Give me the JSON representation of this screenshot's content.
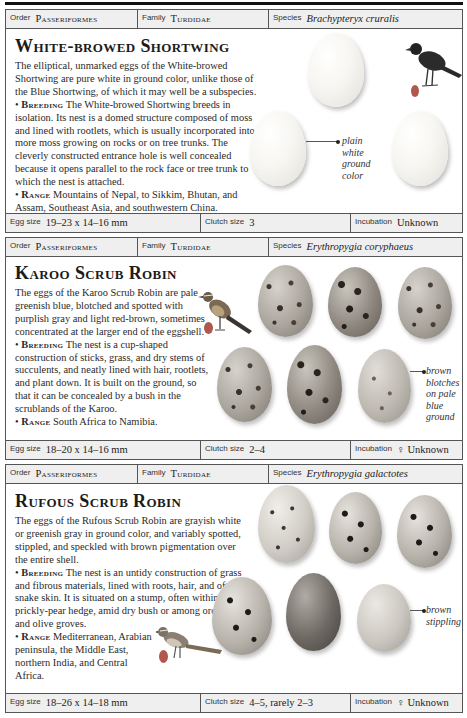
{
  "labels": {
    "order": "Order",
    "family": "Family",
    "species": "Species",
    "egg_size": "Egg size",
    "clutch_size": "Clutch size",
    "incubation": "Incubation"
  },
  "entries": [
    {
      "order": "Passeriformes",
      "family": "Turdidae",
      "species": "Brachypteryx cruralis",
      "title": "White-browed Shortwing",
      "description": "The elliptical, unmarked eggs of the White-browed Shortwing are pure white in ground color, unlike those of the Blue Shortwing, of which it may well be a subspecies.",
      "breeding_label": "Breeding",
      "breeding": "The White-browed Shortwing breeds in isolation. Its nest is a domed structure composed of moss and lined with rootlets, which is usually incorporated into more moss growing on rocks or on tree trunks. The cleverly constructed entrance hole is well concealed because it opens parallel to the rock face or tree trunk to which the nest is attached.",
      "range_label": "Range",
      "range": "Mountains of Nepal, to Sikkim, Bhutan, and Assam, Southeast Asia, and southwestern China.",
      "annotation": "plain white ground color",
      "egg_size": "19–23 x 14–16 mm",
      "clutch_size": "3",
      "incubation": "Unknown",
      "egg_count": 3,
      "egg_color": "#f7f6f2",
      "bird_icon": "dark-shortwing-bird-icon"
    },
    {
      "order": "Passeriformes",
      "family": "Turdidae",
      "species": "Erythropygia coryphaeus",
      "title": "Karoo Scrub Robin",
      "description": "The eggs of the Karoo Scrub Robin are pale greenish blue, blotched and spotted with purplish gray and light red-brown, sometimes concentrated at the larger end of the eggshell.",
      "breeding_label": "Breeding",
      "breeding": "The nest is a cup-shaped construction of sticks, grass, and dry stems of succulents, and neatly lined with hair, rootlets, and plant down. It is built on the ground, so that it can be concealed by a bush in the scrublands of the Karoo.",
      "range_label": "Range",
      "range": "South Africa to Namibia.",
      "annotation": "brown blotches on pale blue ground",
      "egg_size": "18–20 x 14–16 mm",
      "clutch_size": "2–4",
      "incubation": "♀ Unknown",
      "egg_count": 6,
      "egg_color": "#aaa59d",
      "bird_icon": "scrub-robin-bird-icon"
    },
    {
      "order": "Passeriformes",
      "family": "Turdidae",
      "species": "Erythropygia galactotes",
      "title": "Rufous Scrub Robin",
      "description": "The eggs of the Rufous Scrub Robin are grayish white or greenish gray in ground color, and variably spotted, stippled, and speckled with brown pigmentation over the entire shell.",
      "breeding_label": "Breeding",
      "breeding": "The nest is an untidy construction of grass and fibrous materials, lined with roots, hair, and often snake skin. It is situated on a stump, often within a prickly-pear hedge, amid dry bush or among orchards and olive groves.",
      "range_label": "Range",
      "range": "Mediterranean, Arabian peninsula, the Middle East, northern India, and Central Africa.",
      "annotation": "brown stippling",
      "egg_size": "18–26 x 14–18 mm",
      "clutch_size": "4–5, rarely 2–3",
      "incubation": "♀ Unknown",
      "egg_count": 6,
      "egg_color": "#d0ccc5",
      "bird_icon": "rufous-scrub-robin-bird-icon"
    }
  ],
  "colors": {
    "border": "#555555",
    "header_bg": "#efefef",
    "egg_size_dot": "#b0574e"
  }
}
